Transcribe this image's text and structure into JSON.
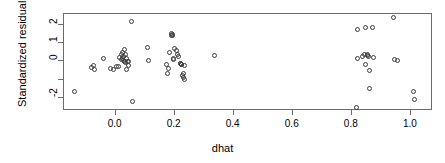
{
  "chart_data": {
    "type": "scatter",
    "title": "",
    "xlabel": "dhat",
    "ylabel": "Standardized residuals",
    "xlim": [
      -0.175,
      1.075
    ],
    "ylim": [
      -2.72,
      2.6
    ],
    "grid": false,
    "legend": null,
    "marker": "open-circle",
    "xticks": [
      0.0,
      0.2,
      0.4,
      0.6,
      0.8,
      1.0
    ],
    "xticklabels": [
      "0.0",
      "0.2",
      "0.4",
      "0.6",
      "0.8",
      "1.0"
    ],
    "yticks": [
      2,
      1,
      0,
      -1,
      -2
    ],
    "yticklabels": [
      "2",
      "1",
      "0",
      "",
      "-2"
    ],
    "points": [
      {
        "x": -0.137,
        "y": -1.68
      },
      {
        "x": -0.078,
        "y": -0.4
      },
      {
        "x": -0.072,
        "y": -0.3
      },
      {
        "x": -0.068,
        "y": -0.52
      },
      {
        "x": -0.038,
        "y": 0.13
      },
      {
        "x": -0.013,
        "y": -0.44
      },
      {
        "x": -0.005,
        "y": -0.5
      },
      {
        "x": 0.007,
        "y": -0.32
      },
      {
        "x": 0.013,
        "y": -0.33
      },
      {
        "x": 0.018,
        "y": 0.16
      },
      {
        "x": 0.022,
        "y": 0.33
      },
      {
        "x": 0.024,
        "y": 0.05
      },
      {
        "x": 0.026,
        "y": 0.12
      },
      {
        "x": 0.028,
        "y": 0.44
      },
      {
        "x": 0.03,
        "y": 0.0
      },
      {
        "x": 0.031,
        "y": 0.21
      },
      {
        "x": 0.033,
        "y": 0.58
      },
      {
        "x": 0.034,
        "y": -0.08
      },
      {
        "x": 0.036,
        "y": 0.3
      },
      {
        "x": 0.038,
        "y": -0.1
      },
      {
        "x": 0.04,
        "y": -0.52
      },
      {
        "x": 0.041,
        "y": 0.09
      },
      {
        "x": 0.043,
        "y": -0.07
      },
      {
        "x": 0.046,
        "y": -0.06
      },
      {
        "x": 0.048,
        "y": -0.3
      },
      {
        "x": 0.058,
        "y": 2.11
      },
      {
        "x": 0.061,
        "y": -2.26
      },
      {
        "x": 0.112,
        "y": 0.71
      },
      {
        "x": 0.115,
        "y": 0.02
      },
      {
        "x": 0.175,
        "y": -0.21
      },
      {
        "x": 0.178,
        "y": -0.7
      },
      {
        "x": 0.181,
        "y": -0.46
      },
      {
        "x": 0.186,
        "y": 0.42
      },
      {
        "x": 0.191,
        "y": 1.46
      },
      {
        "x": 0.194,
        "y": 1.38
      },
      {
        "x": 0.196,
        "y": 1.42
      },
      {
        "x": 0.197,
        "y": 1.34
      },
      {
        "x": 0.199,
        "y": 0.05
      },
      {
        "x": 0.201,
        "y": 0.09
      },
      {
        "x": 0.203,
        "y": 0.66
      },
      {
        "x": 0.21,
        "y": 0.52
      },
      {
        "x": 0.214,
        "y": 0.34
      },
      {
        "x": 0.217,
        "y": 0.22
      },
      {
        "x": 0.222,
        "y": -0.19
      },
      {
        "x": 0.224,
        "y": -0.15
      },
      {
        "x": 0.226,
        "y": -0.24
      },
      {
        "x": 0.228,
        "y": -0.22
      },
      {
        "x": 0.23,
        "y": -0.84
      },
      {
        "x": 0.232,
        "y": -0.95
      },
      {
        "x": 0.234,
        "y": -0.73
      },
      {
        "x": 0.236,
        "y": -1.06
      },
      {
        "x": 0.238,
        "y": -0.26
      },
      {
        "x": 0.339,
        "y": 0.29
      },
      {
        "x": 0.82,
        "y": -2.57
      },
      {
        "x": 0.821,
        "y": 1.72
      },
      {
        "x": 0.824,
        "y": 0.11
      },
      {
        "x": 0.838,
        "y": 0.24
      },
      {
        "x": 0.845,
        "y": 0.3
      },
      {
        "x": 0.849,
        "y": -0.23
      },
      {
        "x": 0.851,
        "y": 1.8
      },
      {
        "x": 0.855,
        "y": 0.35
      },
      {
        "x": 0.858,
        "y": 0.26
      },
      {
        "x": 0.861,
        "y": 0.2
      },
      {
        "x": 0.862,
        "y": -0.53
      },
      {
        "x": 0.864,
        "y": -1.56
      },
      {
        "x": 0.874,
        "y": 1.79
      },
      {
        "x": 0.878,
        "y": 0.18
      },
      {
        "x": 0.946,
        "y": 2.37
      },
      {
        "x": 0.949,
        "y": 0.04
      },
      {
        "x": 0.958,
        "y": 0.02
      },
      {
        "x": 1.012,
        "y": -1.7
      },
      {
        "x": 1.016,
        "y": -2.15
      }
    ]
  },
  "geometry": {
    "plot_left": 63,
    "plot_top": 13,
    "plot_right": 432,
    "plot_bottom": 110
  }
}
